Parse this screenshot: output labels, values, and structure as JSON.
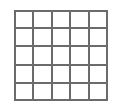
{
  "figure": {
    "name": "grid-figure",
    "type": "grid",
    "rows": 5,
    "columns": 5,
    "cell_count": 25,
    "horizontal_line_count": 6,
    "vertical_line_count": 6,
    "line_color": "#6b6b6b",
    "line_width_px": 2,
    "cell_fill_color": "#ffffff",
    "background_color": "#ffffff",
    "bounds": {
      "left_px": 14,
      "top_px": 10,
      "width_px": 94,
      "height_px": 91
    },
    "cell_width_px": 18.8,
    "cell_height_px": 18.2,
    "row_labels": [
      "1",
      "2",
      "3",
      "4",
      "5"
    ],
    "column_labels": [
      "1",
      "2",
      "3",
      "4",
      "5"
    ],
    "cells": [
      [
        "",
        "",
        "",
        "",
        ""
      ],
      [
        "",
        "",
        "",
        "",
        ""
      ],
      [
        "",
        "",
        "",
        "",
        ""
      ],
      [
        "",
        "",
        "",
        "",
        ""
      ],
      [
        "",
        "",
        "",
        "",
        ""
      ]
    ]
  },
  "canvas": {
    "width_px": 121,
    "height_px": 109,
    "background_color": "#ffffff"
  }
}
